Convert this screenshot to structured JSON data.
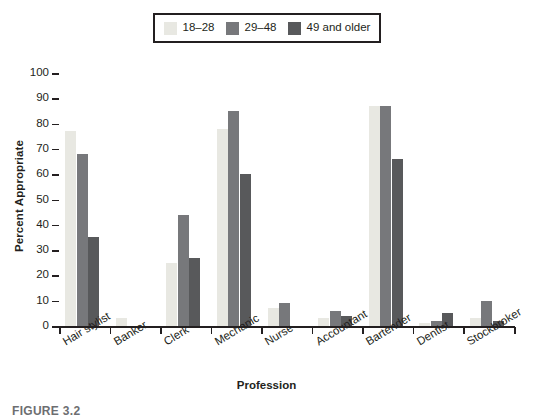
{
  "figure": {
    "caption": "FIGURE 3.2"
  },
  "chart_data": {
    "type": "bar",
    "title": "",
    "xlabel": "Profession",
    "ylabel": "Percent Appropriate",
    "ylim": [
      0,
      100
    ],
    "ytick_step": 10,
    "yticks": [
      0,
      10,
      20,
      30,
      40,
      50,
      60,
      70,
      80,
      90,
      100
    ],
    "grid": true,
    "grid_axis": "y",
    "legend_position": "top-center",
    "legend_border": true,
    "categories": [
      "Hair stylist",
      "Banker",
      "Clerk",
      "Mechanic",
      "Nurse",
      "Accountant",
      "Bartender",
      "Dentist",
      "Stockbroker"
    ],
    "series": [
      {
        "name": "18–28",
        "color": "#e8e8e2",
        "values": [
          77,
          3,
          25,
          78,
          7,
          3,
          87,
          1,
          3
        ]
      },
      {
        "name": "29–48",
        "color": "#77787b",
        "values": [
          68,
          0,
          44,
          85,
          9,
          6,
          87,
          2,
          10
        ]
      },
      {
        "name": "49 and older",
        "color": "#58595b",
        "values": [
          35,
          0,
          27,
          60,
          0,
          4,
          66,
          5,
          2
        ]
      }
    ]
  }
}
